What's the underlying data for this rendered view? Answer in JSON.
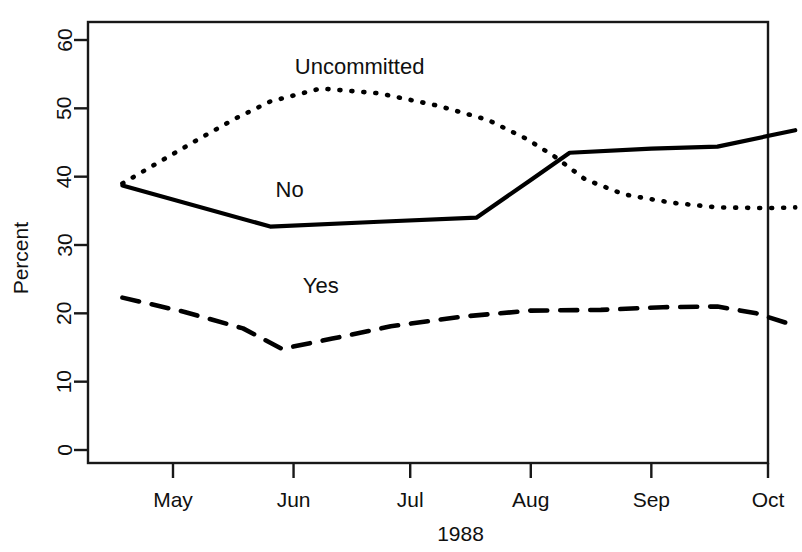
{
  "chart_data": {
    "type": "line",
    "title": "",
    "subtitle": "",
    "xlabel": "1988",
    "ylabel": "Percent",
    "ylim": [
      0,
      62
    ],
    "xlim": [
      105,
      290
    ],
    "grid": false,
    "legend_position": "inline-annotations",
    "yticks": [
      0,
      10,
      20,
      30,
      40,
      50,
      60
    ],
    "ytick_labels": [
      "0",
      "10",
      "20",
      "30",
      "40",
      "50",
      "60"
    ],
    "xticks": [
      122,
      153,
      183,
      214,
      245,
      275
    ],
    "xtick_labels": [
      "May",
      "Jun",
      "Jul",
      "Aug",
      "Sep",
      "Oct"
    ],
    "annotations": [
      {
        "text": "Uncommitted",
        "x": 170,
        "y": 55
      },
      {
        "text": "No",
        "x": 152,
        "y": 37
      },
      {
        "text": "Yes",
        "x": 160,
        "y": 23
      }
    ],
    "series": [
      {
        "name": "Uncommitted",
        "style": "dotted",
        "color": "#000000",
        "x": [
          109,
          118,
          128,
          138,
          147,
          160,
          175,
          190,
          203,
          213,
          220,
          228,
          238,
          250,
          262,
          275,
          282
        ],
        "values": [
          39.0,
          42.0,
          45.3,
          48.5,
          51.0,
          52.9,
          52.2,
          50.4,
          48.3,
          45.5,
          43.0,
          39.6,
          37.4,
          36.2,
          35.5,
          35.4,
          35.5
        ]
      },
      {
        "name": "No",
        "style": "solid",
        "color": "#000000",
        "x": [
          109,
          147,
          175,
          200,
          214,
          224,
          245,
          262,
          282
        ],
        "values": [
          38.7,
          32.7,
          33.4,
          34.0,
          39.5,
          43.5,
          44.1,
          44.4,
          46.8
        ]
      },
      {
        "name": "Yes",
        "style": "dashed",
        "color": "#000000",
        "x": [
          109,
          125,
          140,
          150,
          163,
          178,
          196,
          214,
          232,
          248,
          262,
          272,
          282
        ],
        "values": [
          22.3,
          20.2,
          17.8,
          14.8,
          16.3,
          18.1,
          19.5,
          20.4,
          20.5,
          20.9,
          21.0,
          20.0,
          18.2
        ]
      }
    ]
  }
}
